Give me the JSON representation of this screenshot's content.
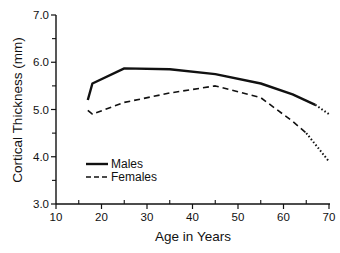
{
  "chart_data": {
    "type": "line",
    "title": "",
    "xlabel": "Age in Years",
    "ylabel": "Cortical Thickness (mm)",
    "xlim": [
      10,
      70
    ],
    "ylim": [
      3.0,
      7.0
    ],
    "x_ticks": [
      10,
      20,
      30,
      40,
      50,
      60,
      70
    ],
    "x_tick_labels": [
      "10",
      "20",
      "30",
      "40",
      "50",
      "60",
      "70"
    ],
    "y_ticks": [
      3.0,
      4.0,
      5.0,
      6.0,
      7.0
    ],
    "y_tick_labels": [
      "3.0",
      "4.0",
      "5.0",
      "6.0",
      "7.0"
    ],
    "grid": false,
    "legend_position": "lower left",
    "series": [
      {
        "name": "Males",
        "style": "solid",
        "color": "#111111",
        "x": [
          17,
          18,
          25,
          35,
          45,
          55,
          62,
          67
        ],
        "values": [
          5.2,
          5.55,
          5.87,
          5.85,
          5.75,
          5.55,
          5.32,
          5.1
        ],
        "extrapolated": {
          "style": "dotted",
          "x": [
            67,
            70
          ],
          "values": [
            5.1,
            4.9
          ]
        }
      },
      {
        "name": "Females",
        "style": "dashed",
        "color": "#111111",
        "x": [
          17,
          18,
          25,
          35,
          45,
          55,
          62,
          65
        ],
        "values": [
          4.98,
          4.9,
          5.15,
          5.35,
          5.5,
          5.25,
          4.75,
          4.5
        ],
        "extrapolated": {
          "style": "dotted",
          "x": [
            65,
            70
          ],
          "values": [
            4.5,
            3.9
          ]
        }
      }
    ]
  },
  "legend": {
    "items": [
      {
        "label": "Males",
        "style": "solid"
      },
      {
        "label": "Females",
        "style": "dashed"
      }
    ]
  }
}
